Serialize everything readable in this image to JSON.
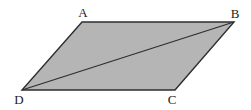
{
  "diagram": {
    "type": "parallelogram-with-diagonal",
    "colors": {
      "fill": "#b5b5b5",
      "stroke": "#2e2e2e",
      "label": "#222222",
      "background": "#ffffff"
    },
    "vertices": {
      "A": {
        "label": "A",
        "x": 82,
        "y": 22,
        "label_x": 83,
        "label_y": 17
      },
      "B": {
        "label": "B",
        "x": 234,
        "y": 22,
        "label_x": 235,
        "label_y": 18
      },
      "C": {
        "label": "C",
        "x": 175,
        "y": 90,
        "label_x": 172,
        "label_y": 104
      },
      "D": {
        "label": "D",
        "x": 22,
        "y": 90,
        "label_x": 19,
        "label_y": 104
      }
    },
    "shape": {
      "name": "parallelogram ABCD",
      "points": "82,22 234,22 175,90 22,90"
    },
    "diagonal": {
      "name": "BD",
      "x1": 234,
      "y1": 22,
      "x2": 22,
      "y2": 90
    }
  }
}
